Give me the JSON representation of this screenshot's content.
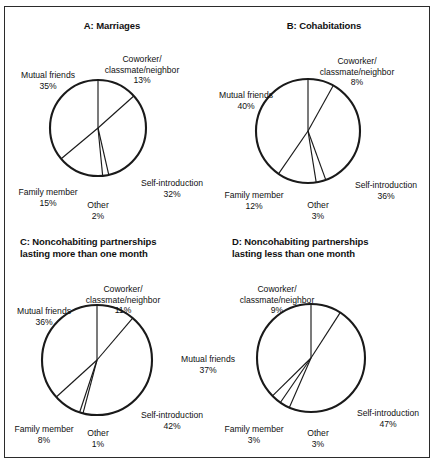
{
  "figure": {
    "categories": [
      "Coworker/classmate/neighbor",
      "Mutual friends",
      "Family member",
      "Other",
      "Self-introduction"
    ]
  },
  "panels": [
    {
      "id": "A",
      "title": "A: Marriages",
      "labels": {
        "coworker": "Coworker/\nclassmate/neighbor",
        "coworker_pct": "13%",
        "mutual": "Mutual friends",
        "mutual_pct": "35%",
        "family": "Family member",
        "family_pct": "15%",
        "other": "Other",
        "other_pct": "2%",
        "self": "Self-introduction",
        "self_pct": "32%"
      }
    },
    {
      "id": "B",
      "title": "B: Cohabitations",
      "labels": {
        "coworker": "Coworker/\nclassmate/neighbor",
        "coworker_pct": "8%",
        "mutual": "Mutual friends",
        "mutual_pct": "40%",
        "family": "Family member",
        "family_pct": "12%",
        "other": "Other",
        "other_pct": "3%",
        "self": "Self-introduction",
        "self_pct": "36%"
      }
    },
    {
      "id": "C",
      "title": "C: Noncohabiting partnerships\nlasting more than one month",
      "labels": {
        "coworker": "Coworker/\nclassmate/neighbor",
        "coworker_pct": "11%",
        "mutual": "Mutual friends",
        "mutual_pct": "36%",
        "family": "Family member",
        "family_pct": "8%",
        "other": "Other",
        "other_pct": "1%",
        "self": "Self-introduction",
        "self_pct": "42%"
      }
    },
    {
      "id": "D",
      "title": "D: Noncohabiting partnerships\nlasting less than one month",
      "labels": {
        "coworker": "Coworker/\nclassmate/neighbor",
        "coworker_pct": "9%",
        "mutual": "Mutual friends",
        "mutual_pct": "37%",
        "family": "Family member",
        "family_pct": "3%",
        "other": "Other",
        "other_pct": "3%",
        "self": "Self-introduction",
        "self_pct": "47%"
      }
    }
  ],
  "chart_data": [
    {
      "type": "pie",
      "title": "A: Marriages",
      "categories": [
        "Coworker/classmate/neighbor",
        "Self-introduction",
        "Other",
        "Family member",
        "Mutual friends"
      ],
      "values": [
        13,
        32,
        2,
        15,
        35
      ],
      "units": "percent",
      "start_angle_deg": 0,
      "direction": "clockwise",
      "legend": "none",
      "grid": false
    },
    {
      "type": "pie",
      "title": "B: Cohabitations",
      "categories": [
        "Coworker/classmate/neighbor",
        "Self-introduction",
        "Other",
        "Family member",
        "Mutual friends"
      ],
      "values": [
        8,
        36,
        3,
        12,
        40
      ],
      "units": "percent",
      "start_angle_deg": 0,
      "direction": "clockwise",
      "legend": "none",
      "grid": false
    },
    {
      "type": "pie",
      "title": "C: Noncohabiting partnerships lasting more than one month",
      "categories": [
        "Coworker/classmate/neighbor",
        "Self-introduction",
        "Other",
        "Family member",
        "Mutual friends"
      ],
      "values": [
        11,
        42,
        1,
        8,
        36
      ],
      "units": "percent",
      "start_angle_deg": 0,
      "direction": "clockwise",
      "legend": "none",
      "grid": false
    },
    {
      "type": "pie",
      "title": "D: Noncohabiting partnerships lasting less than one month",
      "categories": [
        "Coworker/classmate/neighbor",
        "Self-introduction",
        "Other",
        "Family member",
        "Mutual friends"
      ],
      "values": [
        9,
        47,
        3,
        3,
        37
      ],
      "units": "percent",
      "start_angle_deg": 0,
      "direction": "clockwise",
      "legend": "none",
      "grid": false
    }
  ]
}
